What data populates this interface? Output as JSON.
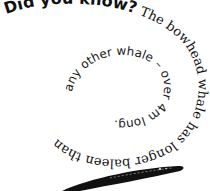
{
  "fact": {
    "heading": "Did you know?",
    "outer_text": " The bowhead whale has longer baleen than",
    "inner_text": "any other whale – over 4m long."
  },
  "illustration": {
    "name": "baleen-plate",
    "color": "#111111"
  }
}
